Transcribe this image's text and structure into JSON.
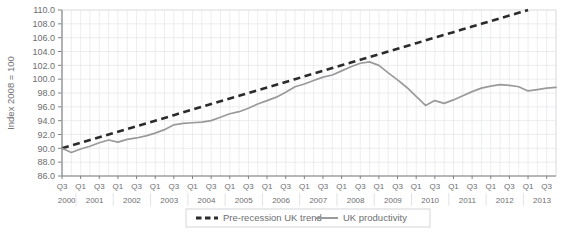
{
  "chart_data": {
    "type": "line",
    "title": "",
    "xlabel": "",
    "ylabel": "Index 2008 = 100",
    "ylim": [
      86.0,
      110.0
    ],
    "ytick_step": 2.0,
    "ytick_labels": [
      "86.0",
      "88.0",
      "90.0",
      "92.0",
      "94.0",
      "96.0",
      "98.0",
      "100.0",
      "102.0",
      "104.0",
      "106.0",
      "108.0",
      "110.0"
    ],
    "grid": true,
    "legend_position": "bottom-center",
    "x": [
      "2000 Q3",
      "2000 Q4",
      "2001 Q1",
      "2001 Q2",
      "2001 Q3",
      "2001 Q4",
      "2002 Q1",
      "2002 Q2",
      "2002 Q3",
      "2002 Q4",
      "2003 Q1",
      "2003 Q2",
      "2003 Q3",
      "2003 Q4",
      "2004 Q1",
      "2004 Q2",
      "2004 Q3",
      "2004 Q4",
      "2005 Q1",
      "2005 Q2",
      "2005 Q3",
      "2005 Q4",
      "2006 Q1",
      "2006 Q2",
      "2006 Q3",
      "2006 Q4",
      "2007 Q1",
      "2007 Q2",
      "2007 Q3",
      "2007 Q4",
      "2008 Q1",
      "2008 Q2",
      "2008 Q3",
      "2008 Q4",
      "2009 Q1",
      "2009 Q2",
      "2009 Q3",
      "2009 Q4",
      "2010 Q1",
      "2010 Q2",
      "2010 Q3",
      "2010 Q4",
      "2011 Q1",
      "2011 Q2",
      "2011 Q3",
      "2011 Q4",
      "2012 Q1",
      "2012 Q2",
      "2012 Q3",
      "2012 Q4",
      "2013 Q1",
      "2013 Q2",
      "2013 Q3",
      "2013 Q4"
    ],
    "quarter_tick_labels": [
      "Q3",
      "",
      "Q1",
      "",
      "Q3",
      "",
      "Q1",
      "",
      "Q3",
      "",
      "Q1",
      "",
      "Q3",
      "",
      "Q1",
      "",
      "Q3",
      "",
      "Q1",
      "",
      "Q3",
      "",
      "Q1",
      "",
      "Q3",
      "",
      "Q1",
      "",
      "Q3",
      "",
      "Q1",
      "",
      "Q3",
      "",
      "Q1",
      "",
      "Q3",
      "",
      "Q1",
      "",
      "Q3",
      "",
      "Q1",
      "",
      "Q3",
      "",
      "Q1",
      "",
      "Q3",
      "",
      "Q1",
      "",
      "Q3",
      ""
    ],
    "year_labels": [
      "2000",
      "2001",
      "2002",
      "2003",
      "2004",
      "2005",
      "2006",
      "2007",
      "2008",
      "2009",
      "2010",
      "2011",
      "2012",
      "2013"
    ],
    "series": [
      {
        "name": "Pre-recession UK trend",
        "style": "dashed",
        "color": "#2b2b2b",
        "values": [
          90.0,
          90.4,
          90.8,
          91.2,
          91.6,
          92.0,
          92.4,
          92.8,
          93.2,
          93.6,
          94.0,
          94.4,
          94.8,
          95.2,
          95.6,
          96.0,
          96.4,
          96.8,
          97.2,
          97.6,
          98.0,
          98.4,
          98.8,
          99.2,
          99.6,
          100.0,
          100.4,
          100.8,
          101.2,
          101.6,
          102.0,
          102.4,
          102.8,
          103.2,
          103.6,
          104.0,
          104.4,
          104.8,
          105.2,
          105.6,
          106.0,
          106.4,
          106.8,
          107.2,
          107.6,
          108.0,
          108.4,
          108.8,
          109.2,
          109.6,
          110.0,
          null,
          null,
          null
        ]
      },
      {
        "name": "UK productivity",
        "style": "solid",
        "color": "#9a9a9a",
        "values": [
          90.0,
          89.4,
          89.9,
          90.3,
          90.8,
          91.2,
          90.9,
          91.3,
          91.5,
          91.8,
          92.2,
          92.7,
          93.4,
          93.6,
          93.7,
          93.8,
          94.0,
          94.5,
          95.0,
          95.3,
          95.8,
          96.4,
          96.9,
          97.4,
          98.1,
          98.9,
          99.3,
          99.8,
          100.3,
          100.6,
          101.2,
          101.8,
          102.3,
          102.5,
          102.0,
          100.9,
          99.9,
          98.8,
          97.5,
          96.2,
          96.9,
          96.5,
          97.0,
          97.6,
          98.2,
          98.7,
          99.0,
          99.2,
          99.1,
          98.9,
          98.3,
          98.5,
          98.7,
          98.8
        ]
      }
    ]
  },
  "legend": {
    "items": [
      {
        "label": "Pre-recession UK trend",
        "style": "dashed"
      },
      {
        "label": "UK productivity",
        "style": "solid"
      }
    ]
  },
  "axis": {
    "y_title": "Index 2008 = 100"
  }
}
